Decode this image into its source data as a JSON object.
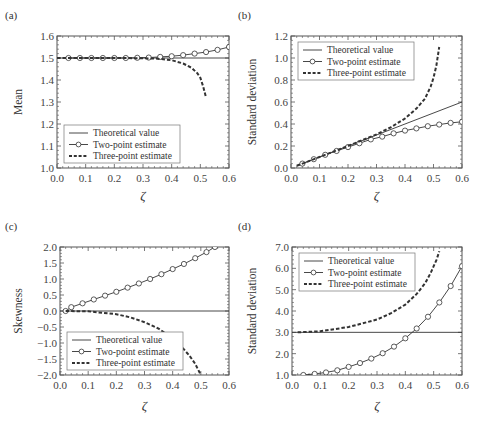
{
  "figure": {
    "xlabel_symbol": "ζ",
    "colors": {
      "line": "#333333",
      "frame": "#555555",
      "marker_fill": "#ffffff"
    }
  },
  "chart_data": [
    {
      "panel": "(a)",
      "type": "line",
      "title": "",
      "xlabel": "ζ",
      "ylabel": "Mean",
      "xlim": [
        0.0,
        0.6
      ],
      "ylim": [
        1.0,
        1.6
      ],
      "xticks": [
        "0.0",
        "0.1",
        "0.2",
        "0.3",
        "0.4",
        "0.5",
        "0.6"
      ],
      "yticks": [
        "1.0",
        "1.1",
        "1.2",
        "1.3",
        "1.4",
        "1.5",
        "1.6"
      ],
      "legend_position": "lower left",
      "legend": [
        "Theoretical value",
        "Two-point estimate",
        "Three-point estimate"
      ],
      "series": [
        {
          "name": "Theoretical value",
          "style": "solid",
          "x": [
            0.0,
            0.6
          ],
          "y": [
            1.5,
            1.5
          ]
        },
        {
          "name": "Two-point estimate",
          "style": "solid-circle",
          "x": [
            0.04,
            0.08,
            0.12,
            0.16,
            0.2,
            0.24,
            0.28,
            0.32,
            0.36,
            0.4,
            0.44,
            0.48,
            0.52,
            0.56,
            0.6
          ],
          "y": [
            1.5,
            1.5,
            1.5,
            1.5,
            1.5,
            1.5,
            1.501,
            1.502,
            1.505,
            1.508,
            1.513,
            1.52,
            1.527,
            1.537,
            1.55
          ]
        },
        {
          "name": "Three-point estimate",
          "style": "dashed",
          "x": [
            0.0,
            0.1,
            0.2,
            0.3,
            0.35,
            0.4,
            0.44,
            0.47,
            0.49,
            0.5,
            0.51,
            0.52
          ],
          "y": [
            1.5,
            1.5,
            1.5,
            1.499,
            1.497,
            1.49,
            1.475,
            1.455,
            1.43,
            1.41,
            1.37,
            1.32
          ]
        }
      ]
    },
    {
      "panel": "(b)",
      "type": "line",
      "title": "",
      "xlabel": "ζ",
      "ylabel": "Standard deviation",
      "xlim": [
        0.0,
        0.6
      ],
      "ylim": [
        0.0,
        1.2
      ],
      "xticks": [
        "0.0",
        "0.1",
        "0.2",
        "0.3",
        "0.4",
        "0.5",
        "0.6"
      ],
      "yticks": [
        "0.0",
        "0.2",
        "0.4",
        "0.6",
        "0.8",
        "1.0",
        "1.2"
      ],
      "legend_position": "upper left",
      "legend": [
        "Theoretical value",
        "Two-point estimate",
        "Three-point estimate"
      ],
      "series": [
        {
          "name": "Theoretical value",
          "style": "solid",
          "x": [
            0.02,
            0.6
          ],
          "y": [
            0.02,
            0.6
          ]
        },
        {
          "name": "Two-point estimate",
          "style": "solid-circle",
          "x": [
            0.04,
            0.08,
            0.12,
            0.16,
            0.2,
            0.24,
            0.28,
            0.32,
            0.36,
            0.4,
            0.44,
            0.48,
            0.52,
            0.56,
            0.6
          ],
          "y": [
            0.04,
            0.08,
            0.12,
            0.155,
            0.19,
            0.225,
            0.26,
            0.285,
            0.315,
            0.34,
            0.36,
            0.38,
            0.395,
            0.41,
            0.42
          ]
        },
        {
          "name": "Three-point estimate",
          "style": "dashed",
          "x": [
            0.02,
            0.1,
            0.2,
            0.3,
            0.35,
            0.4,
            0.44,
            0.47,
            0.49,
            0.5,
            0.51,
            0.52
          ],
          "y": [
            0.02,
            0.1,
            0.2,
            0.305,
            0.37,
            0.45,
            0.54,
            0.63,
            0.74,
            0.82,
            0.93,
            1.1
          ]
        }
      ]
    },
    {
      "panel": "(c)",
      "type": "line",
      "title": "",
      "xlabel": "ζ",
      "ylabel": "Skewness",
      "xlim": [
        0.0,
        0.6
      ],
      "ylim": [
        -2.0,
        2.0
      ],
      "xticks": [
        "0.0",
        "0.1",
        "0.2",
        "0.3",
        "0.4",
        "0.5",
        "0.6"
      ],
      "yticks": [
        "-2.0",
        "-1.5",
        "-1.0",
        "-0.5",
        "0.0",
        "0.5",
        "1.0",
        "1.5",
        "2.0"
      ],
      "legend_position": "lower left",
      "legend": [
        "Theoretical value",
        "Two-point estimate",
        "Three-point estimate"
      ],
      "series": [
        {
          "name": "Theoretical value",
          "style": "solid",
          "x": [
            0.0,
            0.6
          ],
          "y": [
            0.0,
            0.0
          ]
        },
        {
          "name": "Two-point estimate",
          "style": "solid-circle",
          "x": [
            0.02,
            0.04,
            0.08,
            0.12,
            0.16,
            0.2,
            0.24,
            0.28,
            0.32,
            0.36,
            0.4,
            0.44,
            0.48,
            0.52,
            0.55
          ],
          "y": [
            0.0,
            0.12,
            0.24,
            0.36,
            0.48,
            0.6,
            0.73,
            0.86,
            1.0,
            1.15,
            1.31,
            1.47,
            1.65,
            1.84,
            2.0
          ]
        },
        {
          "name": "Three-point estimate",
          "style": "dashed",
          "x": [
            0.02,
            0.1,
            0.2,
            0.25,
            0.3,
            0.35,
            0.4,
            0.43,
            0.46,
            0.48,
            0.5
          ],
          "y": [
            0.0,
            -0.01,
            -0.1,
            -0.2,
            -0.35,
            -0.55,
            -0.85,
            -1.1,
            -1.4,
            -1.65,
            -2.0
          ]
        }
      ]
    },
    {
      "panel": "(d)",
      "type": "line",
      "title": "",
      "xlabel": "ζ",
      "ylabel": "Standard deviation",
      "xlim": [
        0.0,
        0.6
      ],
      "ylim": [
        1.0,
        7.0
      ],
      "xticks": [
        "0.0",
        "0.1",
        "0.2",
        "0.3",
        "0.4",
        "0.5",
        "0.6"
      ],
      "yticks": [
        "1.0",
        "2.0",
        "3.0",
        "4.0",
        "5.0",
        "6.0",
        "7.0"
      ],
      "legend_position": "upper left",
      "legend": [
        "Theoretical value",
        "Two-point estimate",
        "Three-point estimate"
      ],
      "series": [
        {
          "name": "Theoretical value",
          "style": "solid",
          "x": [
            0.0,
            0.6
          ],
          "y": [
            3.0,
            3.0
          ]
        },
        {
          "name": "Two-point estimate",
          "style": "solid-circle",
          "x": [
            0.04,
            0.08,
            0.12,
            0.16,
            0.2,
            0.24,
            0.28,
            0.32,
            0.36,
            0.4,
            0.44,
            0.48,
            0.52,
            0.56,
            0.6
          ],
          "y": [
            1.0,
            1.05,
            1.12,
            1.22,
            1.38,
            1.56,
            1.77,
            2.02,
            2.33,
            2.72,
            3.18,
            3.73,
            4.4,
            5.17,
            6.1
          ]
        },
        {
          "name": "Three-point estimate",
          "style": "dashed",
          "x": [
            0.02,
            0.1,
            0.2,
            0.3,
            0.35,
            0.4,
            0.44,
            0.47,
            0.49,
            0.5,
            0.51,
            0.52
          ],
          "y": [
            3.0,
            3.05,
            3.25,
            3.6,
            3.9,
            4.3,
            4.8,
            5.3,
            5.8,
            6.1,
            6.4,
            6.8
          ]
        }
      ]
    }
  ]
}
